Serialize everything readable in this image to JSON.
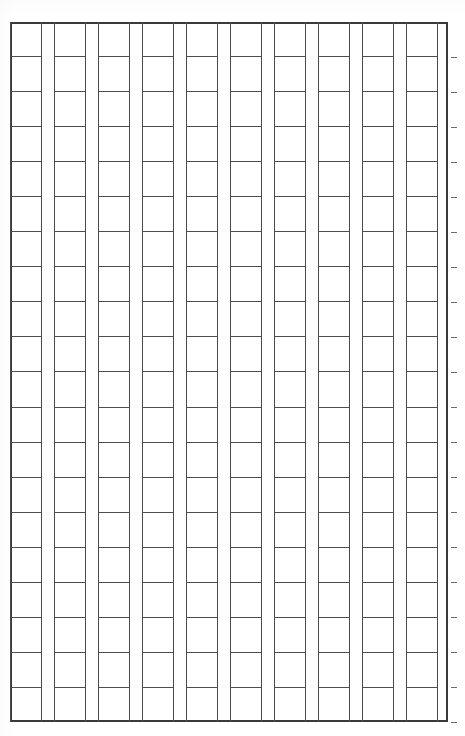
{
  "sheet": {
    "kind": "manuscript-grid-sheet",
    "description": "Blank ruled manuscript grid (genko yoshi style) — empty cells, no written content",
    "width_px": 465,
    "height_px": 736,
    "background_color": "#ffffff",
    "rule_color": "#4a4a4a",
    "frame_color": "#3a3a3a",
    "tick_color": "#6b6b6b"
  },
  "grid": {
    "frame": {
      "left_px": 10,
      "top_px": 22,
      "width_px": 438,
      "height_px": 700
    },
    "columns": 10,
    "rows": 20,
    "cell_width_px": 32,
    "cell_height_px": 35,
    "gutter_width_px": 12,
    "column_pitch_px": 44,
    "row_pitch_px": 35,
    "column_labels": [
      "1",
      "2",
      "3",
      "4",
      "5",
      "6",
      "7",
      "8",
      "9",
      "10"
    ],
    "row_labels": [
      "1",
      "2",
      "3",
      "4",
      "5",
      "6",
      "7",
      "8",
      "9",
      "10",
      "11",
      "12",
      "13",
      "14",
      "15",
      "16",
      "17",
      "18",
      "19",
      "20"
    ],
    "cell_contents": [
      [
        "",
        "",
        "",
        "",
        "",
        "",
        "",
        "",
        "",
        "",
        "",
        "",
        "",
        "",
        "",
        "",
        "",
        "",
        "",
        ""
      ],
      [
        "",
        "",
        "",
        "",
        "",
        "",
        "",
        "",
        "",
        "",
        "",
        "",
        "",
        "",
        "",
        "",
        "",
        "",
        "",
        ""
      ],
      [
        "",
        "",
        "",
        "",
        "",
        "",
        "",
        "",
        "",
        "",
        "",
        "",
        "",
        "",
        "",
        "",
        "",
        "",
        "",
        ""
      ],
      [
        "",
        "",
        "",
        "",
        "",
        "",
        "",
        "",
        "",
        "",
        "",
        "",
        "",
        "",
        "",
        "",
        "",
        "",
        "",
        ""
      ],
      [
        "",
        "",
        "",
        "",
        "",
        "",
        "",
        "",
        "",
        "",
        "",
        "",
        "",
        "",
        "",
        "",
        "",
        "",
        "",
        ""
      ],
      [
        "",
        "",
        "",
        "",
        "",
        "",
        "",
        "",
        "",
        "",
        "",
        "",
        "",
        "",
        "",
        "",
        "",
        "",
        "",
        ""
      ],
      [
        "",
        "",
        "",
        "",
        "",
        "",
        "",
        "",
        "",
        "",
        "",
        "",
        "",
        "",
        "",
        "",
        "",
        "",
        "",
        ""
      ],
      [
        "",
        "",
        "",
        "",
        "",
        "",
        "",
        "",
        "",
        "",
        "",
        "",
        "",
        "",
        "",
        "",
        "",
        "",
        "",
        ""
      ],
      [
        "",
        "",
        "",
        "",
        "",
        "",
        "",
        "",
        "",
        "",
        "",
        "",
        "",
        "",
        "",
        "",
        "",
        "",
        "",
        ""
      ],
      [
        "",
        "",
        "",
        "",
        "",
        "",
        "",
        "",
        "",
        "",
        "",
        "",
        "",
        "",
        "",
        "",
        "",
        "",
        "",
        ""
      ]
    ]
  },
  "right_margin_ticks": {
    "count": 20,
    "spacing_px": 35,
    "start_offset_px": 35,
    "length_px": 6
  }
}
